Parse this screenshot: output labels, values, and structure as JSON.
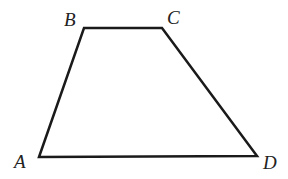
{
  "diagram": {
    "type": "trapezoid",
    "stroke_color": "#1a1a1a",
    "stroke_width": 2.5,
    "vertices": [
      {
        "name": "A",
        "x": 39,
        "y": 157,
        "label_x": 14,
        "label_y": 168
      },
      {
        "name": "B",
        "x": 84,
        "y": 28,
        "label_x": 64,
        "label_y": 26
      },
      {
        "name": "C",
        "x": 162,
        "y": 28,
        "label_x": 167,
        "label_y": 24
      },
      {
        "name": "D",
        "x": 257,
        "y": 156,
        "label_x": 263,
        "label_y": 169
      }
    ],
    "edges": [
      [
        "A",
        "B"
      ],
      [
        "B",
        "C"
      ],
      [
        "C",
        "D"
      ],
      [
        "D",
        "A"
      ]
    ]
  }
}
